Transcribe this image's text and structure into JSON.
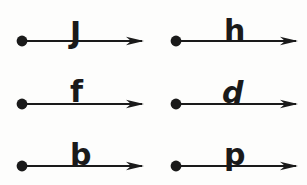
{
  "figure": {
    "title": "",
    "background_color": "#fdfdfc",
    "ink_color": "#1a1a1a",
    "columns": 2,
    "rows": 3,
    "cells": [
      {
        "id": "cell-1",
        "label": "J",
        "style": "upright",
        "label_x": 62,
        "label_y": 6,
        "row": 1,
        "column": 1,
        "x": 8,
        "y": 12,
        "dot_cx": 14,
        "dot_cy": 29,
        "line_x1": 14,
        "line_x2": 134,
        "arrow_tip_x": 136,
        "marker": "filled-circle",
        "arrowhead": "narrow-triangle"
      },
      {
        "id": "cell-2",
        "label": "h",
        "style": "upright",
        "label_x": 62,
        "label_y": 4,
        "row": 1,
        "column": 2,
        "x": 162,
        "y": 12,
        "dot_cx": 14,
        "dot_cy": 29,
        "line_x1": 14,
        "line_x2": 134,
        "arrow_tip_x": 136,
        "marker": "filled-circle",
        "arrowhead": "narrow-triangle"
      },
      {
        "id": "cell-3",
        "label": "f",
        "style": "upright",
        "label_x": 62,
        "label_y": 2,
        "row": 2,
        "column": 1,
        "x": 8,
        "y": 75,
        "dot_cx": 14,
        "dot_cy": 29,
        "line_x1": 14,
        "line_x2": 134,
        "arrow_tip_x": 136,
        "marker": "filled-circle",
        "arrowhead": "narrow-triangle"
      },
      {
        "id": "cell-4",
        "label": "d",
        "style": "italic",
        "label_x": 60,
        "label_y": 3,
        "row": 2,
        "column": 2,
        "x": 162,
        "y": 75,
        "dot_cx": 14,
        "dot_cy": 29,
        "line_x1": 14,
        "line_x2": 134,
        "arrow_tip_x": 136,
        "marker": "filled-circle",
        "arrowhead": "narrow-triangle"
      },
      {
        "id": "cell-5",
        "label": "b",
        "style": "upright",
        "label_x": 62,
        "label_y": 3,
        "row": 3,
        "column": 1,
        "x": 8,
        "y": 137,
        "dot_cx": 14,
        "dot_cy": 29,
        "line_x1": 14,
        "line_x2": 134,
        "arrow_tip_x": 136,
        "marker": "filled-circle",
        "arrowhead": "narrow-triangle"
      },
      {
        "id": "cell-6",
        "label": "p",
        "style": "upright",
        "label_x": 62,
        "label_y": 3,
        "row": 3,
        "column": 2,
        "x": 162,
        "y": 137,
        "dot_cx": 14,
        "dot_cy": 29,
        "line_x1": 14,
        "line_x2": 134,
        "arrow_tip_x": 136,
        "marker": "filled-circle",
        "arrowhead": "narrow-triangle"
      }
    ]
  }
}
